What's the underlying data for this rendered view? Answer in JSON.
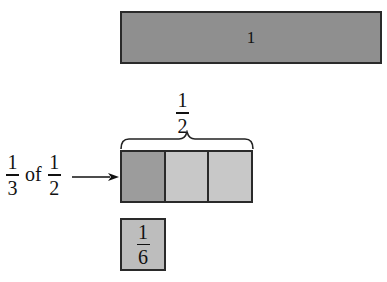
{
  "diagram": {
    "whole_bar": {
      "label": "1",
      "color": "#8f8f8f"
    },
    "half_label": {
      "numerator": "1",
      "denominator": "2"
    },
    "half_bar": {
      "segments": [
        {
          "shade": "dark",
          "color": "#9c9c9c"
        },
        {
          "shade": "light",
          "color": "#c8c8c8"
        },
        {
          "shade": "light",
          "color": "#c8c8c8"
        }
      ]
    },
    "left_label": {
      "first": {
        "numerator": "1",
        "denominator": "3"
      },
      "connector": "of",
      "second": {
        "numerator": "1",
        "denominator": "2"
      }
    },
    "result_box": {
      "numerator": "1",
      "denominator": "6",
      "color": "#bdbdbd"
    }
  }
}
